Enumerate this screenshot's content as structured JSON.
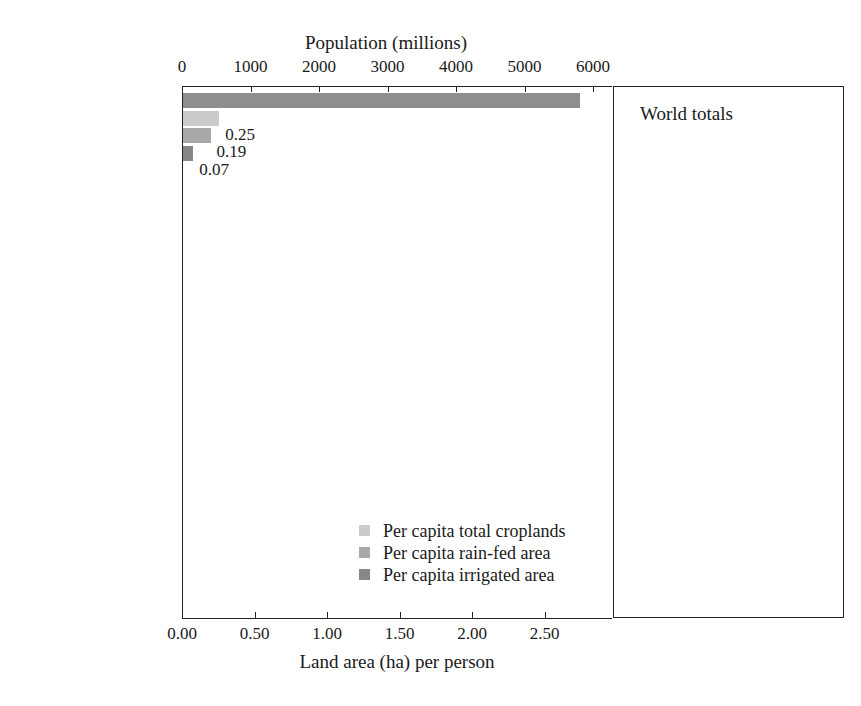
{
  "chart_data": {
    "type": "bar",
    "title": "",
    "orientation": "horizontal-grouped",
    "top_axis": {
      "label": "Population (millions)",
      "ticks": [
        0,
        1000,
        2000,
        3000,
        4000,
        5000,
        6000
      ],
      "tick_labels": [
        "0",
        "1000",
        "2000",
        "3000",
        "4000",
        "5000",
        "6000"
      ],
      "range": [
        0,
        6000
      ]
    },
    "bottom_axis": {
      "label": "Land area (ha) per person",
      "ticks": [
        0.0,
        0.5,
        1.0,
        1.5,
        2.0,
        2.5
      ],
      "tick_labels": [
        "0.00",
        "0.50",
        "1.00",
        "1.50",
        "2.00",
        "2.50"
      ],
      "range": [
        0.0,
        2.97
      ]
    },
    "categories": [
      "World",
      "South America",
      "Oceania",
      "North America",
      "Europe",
      "Asia",
      "Africa"
    ],
    "series": [
      {
        "name": "Population",
        "unit": "millions",
        "axis": "top",
        "color": "#8e8e8e",
        "values": [
          5800,
          320,
          29,
          300,
          730,
          3600,
          780
        ],
        "labeled": false
      },
      {
        "name": "Per capita total croplands",
        "unit": "ha per person",
        "axis": "bottom",
        "color": "#cbcbcb",
        "values": [
          0.25,
          0.51,
          2.19,
          0.72,
          0.36,
          0.17,
          0.25
        ],
        "value_labels": [
          "0.25",
          "0.51",
          "2.19",
          "0.72",
          "0.36",
          "0.17",
          "0.25"
        ]
      },
      {
        "name": "Per capita rain-fed area",
        "unit": "ha per person",
        "axis": "bottom",
        "color": "#a9a9a9",
        "values": [
          0.19,
          0.5,
          1.23,
          0.61,
          0.31,
          0.09,
          0.24
        ],
        "value_labels": [
          "0.19",
          "0.50",
          "1.23",
          "0.61",
          "0.31",
          "0.09",
          "0.24"
        ]
      },
      {
        "name": "Per capita irrigated area",
        "unit": "ha per person",
        "axis": "bottom",
        "color": "#878787",
        "values": [
          0.07,
          0.0,
          0.96,
          0.11,
          0.05,
          0.08,
          0.01
        ],
        "value_labels": [
          "0.07",
          "0.00",
          "0.96",
          "0.11",
          "0.05",
          "0.08",
          "0.01"
        ]
      }
    ],
    "legend": {
      "position": "inside-bottom-center",
      "entries": [
        {
          "label": "Per capita total croplands",
          "color": "#cbcbcb"
        },
        {
          "label": "Per capita rain-fed area",
          "color": "#a9a9a9"
        },
        {
          "label": "Per capita irrigated area",
          "color": "#878787"
        }
      ]
    },
    "inset": {
      "title": "World totals",
      "type": "bar",
      "unit": "Mha",
      "ylim": [
        0,
        1700
      ],
      "bars": [
        {
          "label": "Irrigated area",
          "value": 399,
          "value_label": "399\nMha",
          "color": "#919191"
        },
        {
          "label": "Rain-fed cropland area",
          "value": 1132,
          "value_label": "1132\nMha",
          "color": "#cfcfcf"
        },
        {
          "label": "Total cropland area (irrigated + rain-fed)",
          "value": 1530,
          "value_label": "1530\nMha",
          "color": "#ababab"
        }
      ]
    }
  },
  "top_axis": {
    "title": "Population (millions)",
    "t0": "0",
    "t1": "1000",
    "t2": "2000",
    "t3": "3000",
    "t4": "4000",
    "t5": "5000",
    "t6": "6000"
  },
  "bottom_axis": {
    "title": "Land area (ha) per person",
    "t0": "0.00",
    "t1": "0.50",
    "t2": "1.00",
    "t3": "1.50",
    "t4": "2.00",
    "t5": "2.50"
  },
  "categories": [
    {
      "label": "World",
      "total": "0.25",
      "rainfed": "0.19",
      "irrigated": "0.07"
    },
    {
      "label": "South America",
      "total": "0.51",
      "rainfed": "0.50",
      "irrigated": "0.00"
    },
    {
      "label": "Oceania",
      "total": "2.19",
      "rainfed": "1.23",
      "irrigated": "0.96"
    },
    {
      "label": "North America",
      "total": "0.72",
      "rainfed": "0.61",
      "irrigated": "0.11"
    },
    {
      "label": "Europe",
      "total": "0.36",
      "rainfed": "0.31",
      "irrigated": "0.05"
    },
    {
      "label": "Asia",
      "total": "0.17",
      "rainfed": "0.09",
      "irrigated": "0.08"
    },
    {
      "label": "Africa",
      "total": "0.25",
      "rainfed": "0.24",
      "irrigated": "0.01"
    }
  ],
  "legend": {
    "e0": "Per capita total croplands",
    "e1": "Per capita rain-fed area",
    "e2": "Per capita irrigated area"
  },
  "inset": {
    "title": "World totals",
    "b0_label": "Irrigated area",
    "b0_value": "399\nMha",
    "b1_label": "Rain-fed cropland area",
    "b1_value": "1132\nMha",
    "b2_label": "Total cropland area (irrigated + rain-fed)",
    "b2_value": "1530\nMha"
  },
  "colors": {
    "population": "#8e8e8e",
    "total_croplands": "#cbcbcb",
    "rainfed": "#a9a9a9",
    "irrigated": "#878787",
    "axis": "#222222"
  }
}
